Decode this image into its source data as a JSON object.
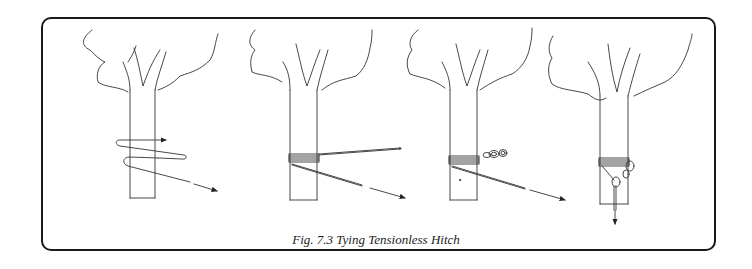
{
  "figure": {
    "caption": "Fig. 7.3  Tying Tensionless Hitch",
    "panels": [
      {
        "step": 1,
        "description": "Rope wrapped around tree trunk, arrows showing direction"
      },
      {
        "step": 2,
        "description": "Multiple wraps around trunk, ends pulled outward"
      },
      {
        "step": 3,
        "description": "Wraps with carabiner chain on the side"
      },
      {
        "step": 4,
        "description": "Carabiner clipped, rope pulled downward"
      }
    ],
    "colors": {
      "line": "#333333",
      "frame": "#1a1a1a",
      "background": "#ffffff"
    }
  }
}
